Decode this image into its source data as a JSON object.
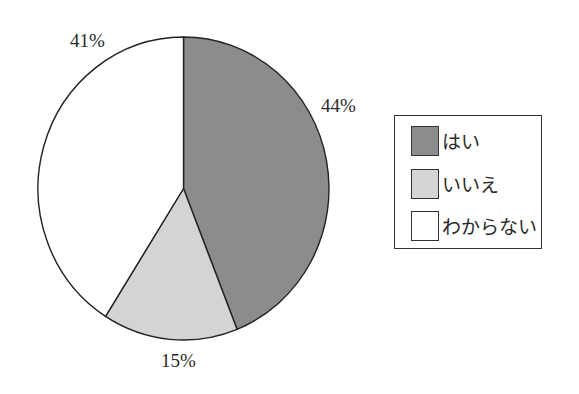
{
  "chart_data": {
    "type": "pie",
    "title": "",
    "categories": [
      "はい",
      "いいえ",
      "わからない"
    ],
    "values": [
      44,
      15,
      41
    ],
    "unit": "%",
    "data_labels": [
      "44%",
      "15%",
      "41%"
    ],
    "colors": [
      "#8c8c8c",
      "#d4d4d4",
      "#ffffff"
    ],
    "start_angle": "12 o'clock",
    "direction": "clockwise",
    "legend_position": "right"
  },
  "labels": {
    "hai": "44%",
    "iie": "15%",
    "wakaranai": "41%"
  },
  "legend": {
    "items": [
      {
        "label": "はい",
        "color": "#8c8c8c"
      },
      {
        "label": "いいえ",
        "color": "#d4d4d4"
      },
      {
        "label": "わからない",
        "color": "#ffffff"
      }
    ]
  }
}
